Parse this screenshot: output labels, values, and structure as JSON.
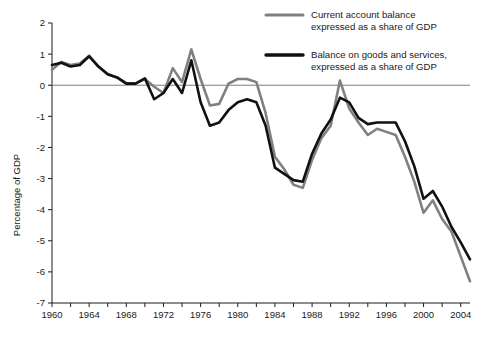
{
  "chart_data": {
    "type": "line",
    "title": "",
    "xlabel": "",
    "ylabel": "Percentage of GDP",
    "xlim": [
      1960,
      2005
    ],
    "ylim": [
      -7,
      2
    ],
    "ytick_values": [
      2,
      1,
      0,
      -1,
      -2,
      -3,
      -4,
      -5,
      -6,
      -7
    ],
    "ytick_labels": [
      "2",
      "1",
      "0",
      "-1",
      "-2",
      "-3",
      "-4",
      "-5",
      "-6",
      "-7"
    ],
    "xtick_labels": [
      "1960",
      "1964",
      "1968",
      "1972",
      "1976",
      "1980",
      "1984",
      "1988",
      "1992",
      "1996",
      "2000",
      "2004"
    ],
    "xtick_values": [
      1960,
      1964,
      1968,
      1972,
      1976,
      1980,
      1984,
      1988,
      1992,
      1996,
      2000,
      2004
    ],
    "xminor_values": [
      1962,
      1966,
      1970,
      1974,
      1978,
      1982,
      1986,
      1990,
      1994,
      1998,
      2002
    ],
    "grid": false,
    "zero_line": true,
    "legend_position": "top-right",
    "x": [
      1960,
      1961,
      1962,
      1963,
      1964,
      1965,
      1966,
      1967,
      1968,
      1969,
      1970,
      1971,
      1972,
      1973,
      1974,
      1975,
      1976,
      1977,
      1978,
      1979,
      1980,
      1981,
      1982,
      1983,
      1984,
      1985,
      1986,
      1987,
      1988,
      1989,
      1990,
      1991,
      1992,
      1993,
      1994,
      1995,
      1996,
      1997,
      1998,
      1999,
      2000,
      2001,
      2002,
      2003,
      2004,
      2005
    ],
    "series": [
      {
        "name": "Current account balance expressed as a share of GDP",
        "color": "#808080",
        "linewidth": 2.6,
        "values": [
          0.5,
          0.75,
          0.65,
          0.7,
          0.95,
          0.6,
          0.35,
          0.25,
          0.07,
          0.06,
          0.2,
          -0.05,
          -0.25,
          0.55,
          0.1,
          1.15,
          0.2,
          -0.65,
          -0.6,
          0.05,
          0.2,
          0.2,
          0.1,
          -0.9,
          -2.3,
          -2.7,
          -3.2,
          -3.3,
          -2.4,
          -1.7,
          -1.3,
          0.15,
          -0.75,
          -1.2,
          -1.6,
          -1.4,
          -1.5,
          -1.6,
          -2.3,
          -3.1,
          -4.1,
          -3.7,
          -4.3,
          -4.7,
          -5.5,
          -6.3
        ]
      },
      {
        "name": "Balance on goods and services, expressed as a share of GDP",
        "color": "#111111",
        "linewidth": 2.6,
        "values": [
          0.65,
          0.72,
          0.6,
          0.65,
          0.93,
          0.6,
          0.35,
          0.25,
          0.05,
          0.05,
          0.22,
          -0.45,
          -0.25,
          0.2,
          -0.25,
          0.8,
          -0.55,
          -1.3,
          -1.2,
          -0.8,
          -0.55,
          -0.45,
          -0.55,
          -1.3,
          -2.65,
          -2.85,
          -3.05,
          -3.1,
          -2.2,
          -1.55,
          -1.1,
          -0.4,
          -0.55,
          -1.05,
          -1.25,
          -1.2,
          -1.2,
          -1.2,
          -1.8,
          -2.6,
          -3.65,
          -3.4,
          -3.9,
          -4.55,
          -5.05,
          -5.6
        ]
      }
    ]
  },
  "legend": {
    "entries": [
      {
        "line1": "Current account balance",
        "line2": "expressed as a share of GDP",
        "color": "#808080",
        "swatch_name": "legend-swatch-current-account"
      },
      {
        "line1": "Balance on goods and services,",
        "line2": "expressed as a share of GDP",
        "color": "#111111",
        "swatch_name": "legend-swatch-goods-services"
      }
    ]
  },
  "axes": {
    "ylabel": "Percentage of GDP"
  }
}
